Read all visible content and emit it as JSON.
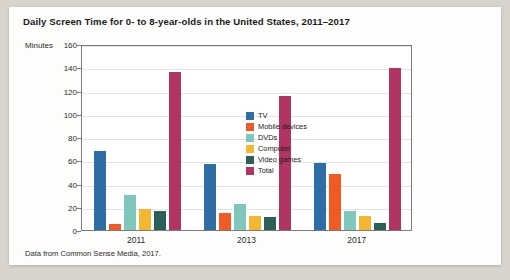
{
  "chart_data": {
    "type": "bar",
    "title": "Daily Screen Time for 0- to 8-year-olds in the United States, 2011–2017",
    "xlabel": "",
    "ylabel": "Minutes",
    "ylim": [
      0,
      160
    ],
    "yticks": [
      0,
      20,
      40,
      60,
      80,
      100,
      120,
      140,
      160
    ],
    "grid": true,
    "legend_position": "inside-center",
    "categories": [
      "2011",
      "2013",
      "2017"
    ],
    "series": [
      {
        "name": "TV",
        "color": "#2f6ea5",
        "values": [
          68,
          57,
          58
        ]
      },
      {
        "name": "Mobile devices",
        "color": "#f15a24",
        "values": [
          5,
          15,
          48
        ]
      },
      {
        "name": "DVDs",
        "color": "#7fc6bd",
        "values": [
          30,
          22,
          16
        ]
      },
      {
        "name": "Computer",
        "color": "#f5b731",
        "values": [
          18,
          12,
          12
        ]
      },
      {
        "name": "Video games",
        "color": "#2c5f5a",
        "values": [
          16,
          11,
          6
        ]
      },
      {
        "name": "Total",
        "color": "#b13562",
        "values": [
          136,
          115,
          139
        ]
      }
    ],
    "source_note": "Data from Common Sense Media, 2017."
  },
  "figure": {
    "title": "Daily Screen Time for 0- to 8-year-olds in the United States, 2011–2017",
    "axis_label_minutes": "Minutes",
    "source_note": "Data from Common Sense Media, 2017."
  },
  "colors": {
    "background": "#d8d4cc",
    "card": "#fdfdfb",
    "axis": "#7b7b7b",
    "grid": "#e2e2e2",
    "text": "#1b1b1b"
  }
}
